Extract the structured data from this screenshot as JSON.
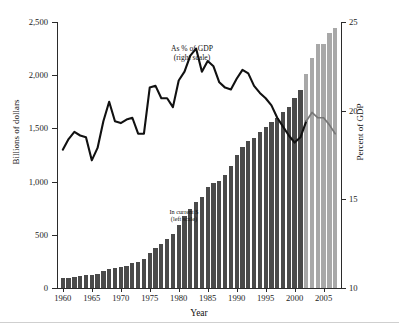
{
  "figure": {
    "xtitle": "Year",
    "ytitle_left": "Billions of dollars",
    "ytitle_right": "Percent of GDP",
    "annotation_gdp": "As % of GDP\n(right scale)",
    "annotation_current": "In current $\n(left scale)",
    "bar_color_actual": "#4a4a4a",
    "bar_color_projected": "#a8a8a8",
    "line_color_actual": "#111111",
    "line_color_projected": "#777777",
    "axis_color": "#2b2b2b"
  },
  "chart_data": {
    "type": "bar",
    "title": "",
    "xlabel": "Year",
    "ylabel": "Billions of dollars",
    "ylabel_right": "Percent of GDP",
    "grid": false,
    "legend": "inline annotations",
    "xlim": [
      1959,
      2008
    ],
    "ylim": [
      0,
      2500
    ],
    "ylim_right": [
      10,
      25
    ],
    "yticks": [
      0,
      500,
      1000,
      1500,
      2000,
      2500
    ],
    "ytick_labels": [
      "0",
      "500",
      "1,000",
      "1,500",
      "2,000",
      "2,500"
    ],
    "yticks_right": [
      10,
      15,
      20,
      25
    ],
    "ytick_labels_right": [
      "10",
      "15",
      "20",
      "25"
    ],
    "xticks": [
      1960,
      1965,
      1970,
      1975,
      1980,
      1985,
      1990,
      1995,
      2000,
      2005
    ],
    "xtick_labels": [
      "1960",
      "1965",
      "1970",
      "1975",
      "1980",
      "1985",
      "1990",
      "1995",
      "2000",
      "2005"
    ],
    "projection_start_year": 2002,
    "x": [
      1960,
      1961,
      1962,
      1963,
      1964,
      1965,
      1966,
      1967,
      1968,
      1969,
      1970,
      1971,
      1972,
      1973,
      1974,
      1975,
      1976,
      1977,
      1978,
      1979,
      1980,
      1981,
      1982,
      1983,
      1984,
      1985,
      1986,
      1987,
      1988,
      1989,
      1990,
      1991,
      1992,
      1993,
      1994,
      1995,
      1996,
      1997,
      1998,
      1999,
      2000,
      2001,
      2002,
      2003,
      2004,
      2005,
      2006,
      2007
    ],
    "series": [
      {
        "name": "In current $ (left scale)",
        "axis": "left",
        "type": "bar",
        "unit": "billions of dollars",
        "values": [
          92,
          98,
          107,
          111,
          119,
          118,
          135,
          157,
          178,
          184,
          196,
          210,
          231,
          246,
          269,
          332,
          372,
          409,
          459,
          504,
          591,
          678,
          746,
          808,
          852,
          946,
          990,
          1004,
          1064,
          1143,
          1253,
          1324,
          1382,
          1409,
          1462,
          1516,
          1561,
          1601,
          1653,
          1702,
          1789,
          1863,
          2011,
          2160,
          2293,
          2292,
          2400,
          2440
        ]
      },
      {
        "name": "As % of GDP (right scale)",
        "axis": "right",
        "type": "line",
        "unit": "percent of GDP",
        "values": [
          17.8,
          18.4,
          18.8,
          18.6,
          18.5,
          17.2,
          17.9,
          19.4,
          20.5,
          19.4,
          19.3,
          19.5,
          19.6,
          18.7,
          18.7,
          21.3,
          21.4,
          20.7,
          20.7,
          20.2,
          21.7,
          22.2,
          23.1,
          23.5,
          22.2,
          22.8,
          22.5,
          21.6,
          21.3,
          21.2,
          21.8,
          22.3,
          22.1,
          21.4,
          21.0,
          20.7,
          20.3,
          19.6,
          19.1,
          18.6,
          18.2,
          18.5,
          19.4,
          19.9,
          19.6,
          19.6,
          19.2,
          18.7
        ]
      }
    ]
  }
}
